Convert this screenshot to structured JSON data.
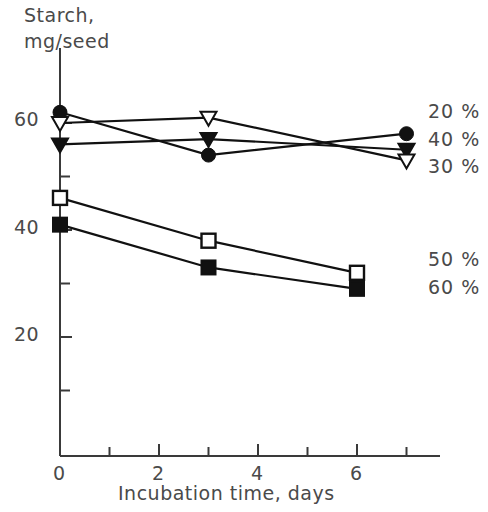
{
  "chart_data": {
    "type": "line",
    "title": "",
    "ylabel_line1": "Starch,",
    "ylabel_line2": "mg/seed",
    "xlabel": "Incubation time, days",
    "xlim": [
      0,
      7
    ],
    "ylim": [
      0,
      70
    ],
    "x_ticks_major": [
      0,
      2,
      4,
      6
    ],
    "x_ticks_all": [
      0,
      1,
      2,
      3,
      4,
      5,
      6,
      7
    ],
    "x_tick_labels": [
      "0",
      "2",
      "4",
      "6"
    ],
    "y_ticks_major": [
      20,
      40,
      60
    ],
    "y_ticks_minor": [
      10,
      30,
      50
    ],
    "y_tick_labels": [
      "20",
      "40",
      "60"
    ],
    "grid": false,
    "legend_position": "right",
    "series": [
      {
        "name": "20 %",
        "marker": "filled-circle",
        "x": [
          0,
          3,
          7
        ],
        "values": [
          62,
          54,
          58
        ]
      },
      {
        "name": "40 %",
        "marker": "filled-triangle-down",
        "x": [
          0,
          3,
          7
        ],
        "values": [
          56,
          57,
          55
        ]
      },
      {
        "name": "30 %",
        "marker": "open-triangle-down",
        "x": [
          0,
          3,
          7
        ],
        "values": [
          60,
          61,
          53
        ]
      },
      {
        "name": "50 %",
        "marker": "open-square",
        "x": [
          0,
          3,
          6
        ],
        "values": [
          46,
          38,
          32
        ]
      },
      {
        "name": "60 %",
        "marker": "filled-square",
        "x": [
          0,
          3,
          6
        ],
        "values": [
          41,
          33,
          29
        ]
      }
    ]
  },
  "legend": {
    "entries": [
      {
        "label": "20 %"
      },
      {
        "label": "40 %"
      },
      {
        "label": "30 %"
      },
      {
        "label": "50 %"
      },
      {
        "label": "60 %"
      }
    ]
  },
  "axes": {
    "y_title_line1": "Starch,",
    "y_title_line2": "mg/seed",
    "x_title": "Incubation time, days",
    "y_labels": [
      "60",
      "40",
      "20"
    ],
    "x_labels": [
      "0",
      "2",
      "4",
      "6"
    ]
  },
  "colors": {
    "line": "#111111",
    "axis": "#3a3a3a",
    "text": "#4a4a4a",
    "background": "#ffffff"
  }
}
